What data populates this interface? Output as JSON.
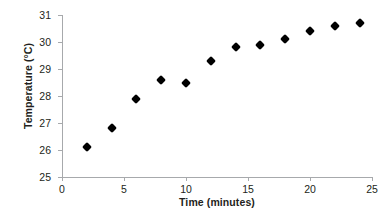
{
  "chart_data": {
    "type": "scatter",
    "title": "",
    "xlabel": "Time (minutes)",
    "ylabel": "Temperature (°C)",
    "xlim": [
      0,
      25
    ],
    "ylim": [
      25,
      31
    ],
    "xticks": [
      0,
      5,
      10,
      15,
      20,
      25
    ],
    "yticks": [
      25,
      26,
      27,
      28,
      29,
      30,
      31
    ],
    "xtick_labels": [
      "0",
      "5",
      "10",
      "15",
      "20",
      "25"
    ],
    "ytick_labels": [
      "25",
      "26",
      "27",
      "28",
      "29",
      "30",
      "31"
    ],
    "grid": false,
    "legend": null,
    "marker": "diamond",
    "marker_color": "#000000",
    "axis_color": "#a7a9ac",
    "text_color": "#231f20",
    "x": [
      2,
      4,
      6,
      8,
      10,
      12,
      14,
      16,
      18,
      20,
      22,
      24
    ],
    "values": [
      26.1,
      26.8,
      27.9,
      28.6,
      28.5,
      29.3,
      29.8,
      29.9,
      30.1,
      30.4,
      30.6,
      30.7
    ],
    "points": [
      {
        "x": 2,
        "y": 26.1
      },
      {
        "x": 4,
        "y": 26.8
      },
      {
        "x": 6,
        "y": 27.9
      },
      {
        "x": 8,
        "y": 28.6
      },
      {
        "x": 10,
        "y": 28.5
      },
      {
        "x": 12,
        "y": 29.3
      },
      {
        "x": 14,
        "y": 29.8
      },
      {
        "x": 16,
        "y": 29.9
      },
      {
        "x": 18,
        "y": 30.1
      },
      {
        "x": 20,
        "y": 30.4
      },
      {
        "x": 22,
        "y": 30.6
      },
      {
        "x": 24,
        "y": 30.7
      }
    ]
  }
}
